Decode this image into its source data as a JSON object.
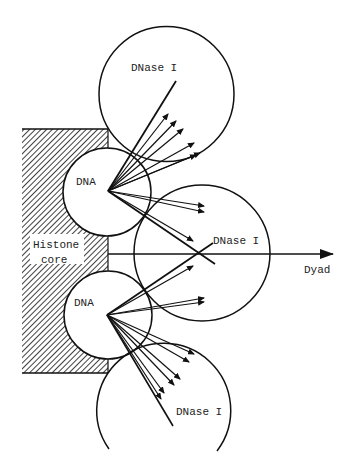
{
  "labels": {
    "histone_line1": "Histone",
    "histone_line2": "core",
    "dna_upper": "DNA",
    "dna_lower": "DNA",
    "dnase_top": "DNase I",
    "dnase_middle": "DNase I",
    "dnase_bottom": "DNase I",
    "dyad": "Dyad"
  },
  "colors": {
    "line": "#111111",
    "background": "#ffffff"
  }
}
